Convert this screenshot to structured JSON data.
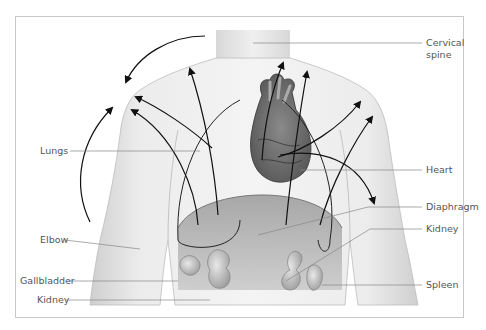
{
  "figure": {
    "type": "anatomical diagram",
    "labels": {
      "cervical_spine_line1": "Cervical",
      "cervical_spine_line2": "spine",
      "lungs": "Lungs",
      "heart": "Heart",
      "elbow": "Elbow",
      "diaphragm": "Diaphragm",
      "kidney_right": "Kidney",
      "gallbladder": "Gallbladder",
      "kidney_left": "Kidney",
      "spleen": "Spleen"
    },
    "colors": {
      "frame": "#c8c8c8",
      "body_fill": "#e8e8e8",
      "arrow": "#111111",
      "leader_line": "#888888",
      "label_text": "#555555"
    }
  }
}
